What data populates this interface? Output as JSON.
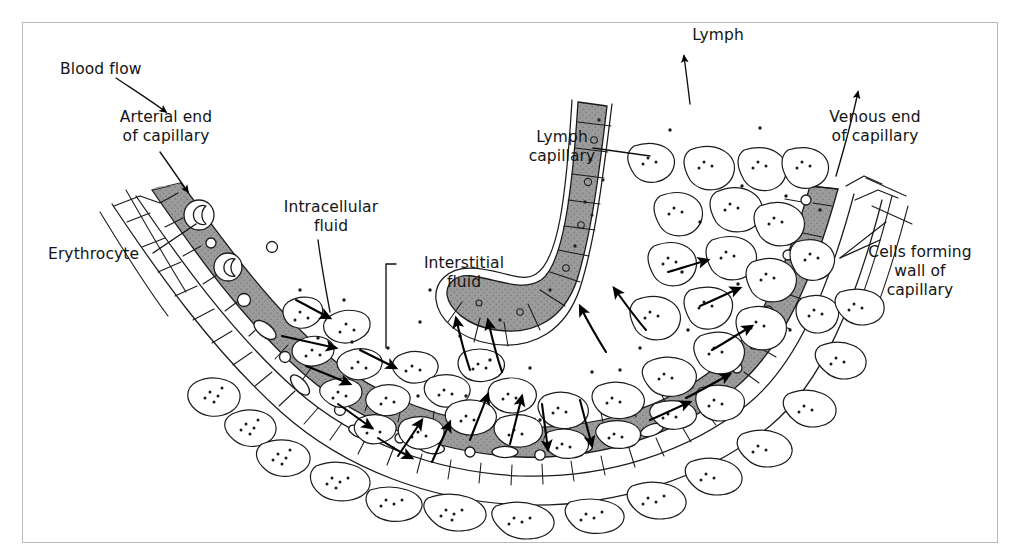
{
  "figure": {
    "background_color": "#ffffff",
    "border_color": "#b9b9b9"
  },
  "palette": {
    "lumen_fill": "#9b9b9b",
    "lumen_fill_light": "#a9a9a9",
    "outline": "#1a1a1a",
    "cell_fill": "#ffffff",
    "arrow_fill": "#000000",
    "stipple": "#222222"
  },
  "labels": [
    {
      "id": "blood-flow",
      "text": "Blood flow",
      "x": 60,
      "y": 60,
      "align": "left",
      "leader": "arrow"
    },
    {
      "id": "arterial-end",
      "text": "Arterial end\nof capillary",
      "x": 86,
      "y": 108,
      "align": "center",
      "leader": "arrow"
    },
    {
      "id": "erythrocyte",
      "text": "Erythrocyte",
      "x": 48,
      "y": 245,
      "align": "left",
      "leader": "line"
    },
    {
      "id": "intracellular",
      "text": "Intracellular\nfluid",
      "x": 266,
      "y": 198,
      "align": "center",
      "leader": "line"
    },
    {
      "id": "interstitial",
      "text": "Interstitial\nfluid",
      "x": 404,
      "y": 254,
      "align": "center",
      "leader": "line"
    },
    {
      "id": "lymph",
      "text": "Lymph",
      "x": 676,
      "y": 26,
      "align": "center",
      "leader": "arrow"
    },
    {
      "id": "lymph-capillary",
      "text": "Lymph\ncapillary",
      "x": 517,
      "y": 128,
      "align": "center",
      "leader": "line"
    },
    {
      "id": "venous-end",
      "text": "Venous end\nof capillary",
      "x": 812,
      "y": 108,
      "align": "center",
      "leader": "arrow"
    },
    {
      "id": "cells-forming-wall",
      "text": "Cells forming\nwall of\ncapillary",
      "x": 845,
      "y": 243,
      "align": "center",
      "leader": "line"
    }
  ],
  "structures": {
    "blood_capillary": "U-shaped blood capillary running from arterial end at upper left, around a broad curve at the bottom, up to the venous end at upper right",
    "lymph_capillary": "blind-ended lymphatic capillary descending from top centre-right and hooking left at its closed end",
    "tissue_cells": "irregular pale tissue cells with stippled cytoplasm filling the interstitial space",
    "erythrocytes": "crescent and oval red blood cells inside the shaded capillary lumen",
    "exchange_arrows": "solid black arrows showing fluid moving out of the arterial end, through the interstitial space, into the lymph capillary and back into the venous end"
  }
}
